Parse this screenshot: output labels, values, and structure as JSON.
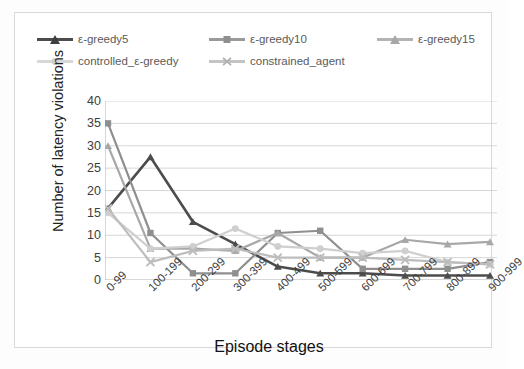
{
  "chart_data": {
    "type": "line",
    "title": "",
    "xlabel": "Episode stages",
    "ylabel": "Number of latency violations",
    "categories": [
      "0-99",
      "100-199",
      "200-299",
      "300-399",
      "400-499",
      "500-599",
      "600-699",
      "700-799",
      "800-899",
      "900-999"
    ],
    "ylim": [
      0,
      40
    ],
    "yticks": [
      0,
      5,
      10,
      15,
      20,
      25,
      30,
      35,
      40
    ],
    "grid": true,
    "legend_position": "top",
    "series": [
      {
        "name": "ε-greedy5",
        "color": "#4c4c4c",
        "marker": "triangle",
        "values": [
          16,
          27.5,
          13,
          8,
          3,
          1.5,
          1.5,
          1,
          1,
          1
        ]
      },
      {
        "name": "ε-greedy10",
        "color": "#8f8f8f",
        "marker": "square",
        "values": [
          35,
          10.5,
          1.5,
          1.5,
          10.5,
          11,
          2.5,
          2.5,
          2.5,
          4
        ]
      },
      {
        "name": "ε-greedy15",
        "color": "#a8a8a8",
        "marker": "triangle",
        "values": [
          30,
          7,
          7,
          6.5,
          10.5,
          5,
          5,
          9,
          8,
          8.5
        ]
      },
      {
        "name": "controlled_ε-greedy",
        "color": "#cfcfcf",
        "marker": "circle",
        "values": [
          15,
          7,
          7.5,
          11.5,
          7.5,
          7,
          6,
          6.5,
          4,
          3.5
        ]
      },
      {
        "name": "constrained_agent",
        "color": "#bdbdbd",
        "marker": "cross",
        "values": [
          16,
          4,
          6.5,
          7,
          5,
          5,
          5,
          4.5,
          4,
          3.5
        ]
      }
    ]
  },
  "legend": {
    "items": [
      {
        "label": "ε-greedy5"
      },
      {
        "label": "ε-greedy10"
      },
      {
        "label": "ε-greedy15"
      },
      {
        "label": "controlled_ε-greedy"
      },
      {
        "label": "constrained_agent"
      }
    ]
  },
  "axes": {
    "y_title": "Number of latency violations",
    "x_title": "Episode stages",
    "y_tick_labels": [
      "40",
      "35",
      "30",
      "25",
      "20",
      "15",
      "10",
      "5",
      "0"
    ],
    "x_tick_labels": [
      "0-99",
      "100-199",
      "200-299",
      "300-399",
      "400-499",
      "500-599",
      "600-699",
      "700-799",
      "800-899",
      "900-999"
    ]
  }
}
